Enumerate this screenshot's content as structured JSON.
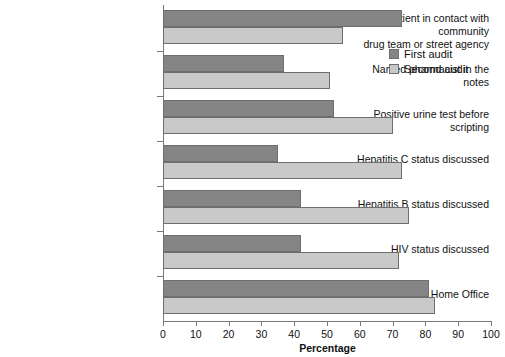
{
  "chart_data": {
    "type": "bar",
    "orientation": "horizontal",
    "title": "",
    "xlabel": "Percentage",
    "ylabel": "",
    "xlim": [
      0,
      100
    ],
    "grid": false,
    "legend_position": "top-right",
    "xticks": [
      "0",
      "10",
      "20",
      "30",
      "40",
      "50",
      "60",
      "70",
      "80",
      "90",
      "100"
    ],
    "categories": [
      "Patient in contact with community drug team or street agency",
      "Named pharmacist in the notes",
      "Positive urine test before scripting",
      "Hepatitis C status discussed",
      "Hepatitis B status discussed",
      "HIV status discussed",
      "Notification to the Home Office"
    ],
    "category_lines": [
      [
        "Patient in contact with community",
        "drug team or street agency"
      ],
      [
        "Named pharmacist in the notes"
      ],
      [
        "Positive urine test before scripting"
      ],
      [
        "Hepatitis C status discussed"
      ],
      [
        "Hepatitis B status discussed"
      ],
      [
        "HIV status discussed"
      ],
      [
        "Notification to the Home Office"
      ]
    ],
    "series": [
      {
        "name": "First audit",
        "color": "#858585",
        "values": [
          73,
          37,
          52,
          35,
          42,
          42,
          81
        ]
      },
      {
        "name": "Second audit",
        "color": "#c9c9c9",
        "values": [
          55,
          51,
          70,
          73,
          75,
          72,
          83
        ]
      }
    ]
  },
  "legend": {
    "items": [
      {
        "label": "First audit"
      },
      {
        "label": "Second audit"
      }
    ]
  }
}
